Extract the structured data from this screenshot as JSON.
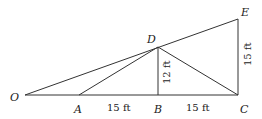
{
  "diagram": {
    "points": {
      "O": {
        "label": "O",
        "x": 25,
        "y": 95
      },
      "A": {
        "label": "A",
        "x": 79,
        "y": 95
      },
      "B": {
        "label": "B",
        "x": 158,
        "y": 95
      },
      "C": {
        "label": "C",
        "x": 238,
        "y": 95
      },
      "D": {
        "label": "D",
        "x": 158,
        "y": 47
      },
      "E": {
        "label": "E",
        "x": 238,
        "y": 19
      }
    },
    "segments": [
      [
        "O",
        "C"
      ],
      [
        "O",
        "E"
      ],
      [
        "A",
        "D"
      ],
      [
        "D",
        "B"
      ],
      [
        "D",
        "C"
      ],
      [
        "E",
        "C"
      ]
    ],
    "dimensions": {
      "AB": "15 ft",
      "BC": "15 ft",
      "DB": "12 ft",
      "EC": "15 ft"
    },
    "colors": {
      "line": "#333333",
      "text": "#222222"
    }
  }
}
